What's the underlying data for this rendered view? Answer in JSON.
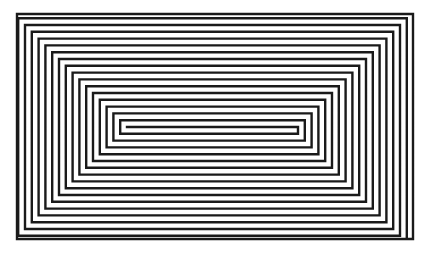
{
  "figure": {
    "type": "rectangular-spiral",
    "stroke_color": "#1a1a1a",
    "background_color": "#ffffff",
    "outer_bounds": {
      "left": 17,
      "top": 14,
      "right": 413,
      "bottom": 239
    },
    "center_line": {
      "y": 127,
      "x_start": 127,
      "x_end": 298
    },
    "step": 6.8,
    "loops": 16
  }
}
